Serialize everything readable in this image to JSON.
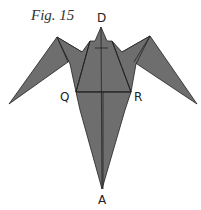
{
  "figure": {
    "title": "Fig. 15",
    "labels": {
      "D": "D",
      "Q": "Q",
      "R": "R",
      "A": "A"
    },
    "colors": {
      "fill": "#6e6e6e",
      "stroke": "#222222",
      "background": "#ffffff"
    }
  }
}
